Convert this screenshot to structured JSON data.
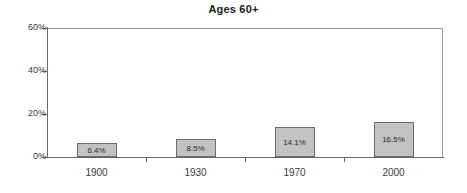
{
  "chart_data": {
    "type": "bar",
    "title": "Ages 60+",
    "xlabel": "",
    "ylabel": "",
    "categories": [
      "1900",
      "1930",
      "1970",
      "2000"
    ],
    "values": [
      6.4,
      8.5,
      14.1,
      16.5
    ],
    "data_labels": [
      "6.4%",
      "8.5%",
      "14.1%",
      "16.5%"
    ],
    "ylim": [
      0,
      60
    ],
    "yticks": [
      0,
      20,
      40,
      60
    ],
    "ytick_labels": [
      "0%",
      "20%",
      "40%",
      "60%"
    ],
    "grid": false,
    "legend": null,
    "series": [
      {
        "name": "Ages 60+",
        "values": [
          6.4,
          8.5,
          14.1,
          16.5
        ]
      }
    ],
    "colors": {
      "bar_fill": "#c2c2c2",
      "bar_border": "#6b6b6b",
      "axis": "#666666",
      "plot_border": "#9a9a9a",
      "text": "#3c3c3c",
      "title": "#1a1a1a",
      "background": "#ffffff"
    }
  }
}
